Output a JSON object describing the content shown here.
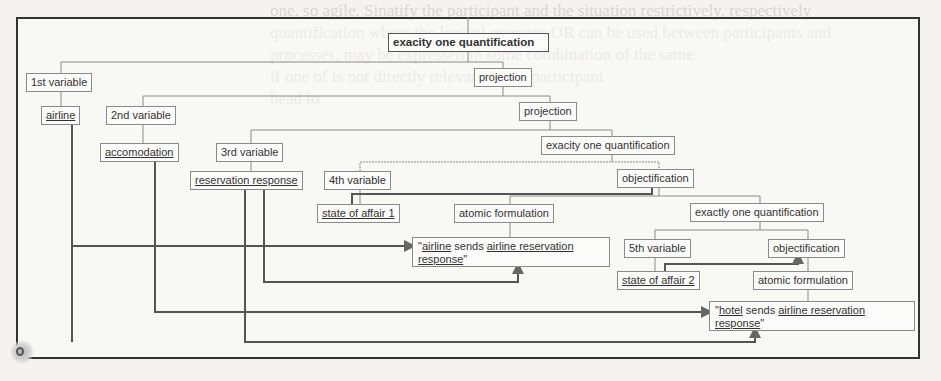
{
  "diagram": {
    "nodes": {
      "root_quant": "exacity one quantification",
      "var1": "1st variable",
      "projection1": "projection",
      "airline": "airline",
      "var2": "2nd variable",
      "projection2": "projection",
      "accomodation": "accomodation",
      "var3": "3rd variable",
      "quant2": "exacity one quantification",
      "reservation_response": "reservation response",
      "var4": "4th variable",
      "objectification1": "objectification",
      "state_of_affair1": "state of affair 1",
      "atomic_formulation1": "atomic formulation",
      "quant3": "exactly one quantification",
      "var5": "5th variable",
      "objectification2": "objectification",
      "state_of_affair2": "state of affair 2",
      "atomic_formulation2": "atomic formulation"
    },
    "quote1": {
      "open": "\"",
      "subject": "airline",
      "verb": " sends ",
      "object1": "airline reservation",
      "object2": "response",
      "close": "\""
    },
    "quote2": {
      "open": "\"",
      "subject": "hotel",
      "verb": " sends ",
      "object1": "airline reservation",
      "object2": "response",
      "close": "\""
    }
  },
  "background_text": [
    "one, so agile, Sinatify the participant and the situation restrictively, respectively",
    "quantification where the logical operator OR can be used between participants and",
    "processes, may be expressed in some combination of the same",
    "if one of is not directly relevant to the participant",
    "head to"
  ]
}
